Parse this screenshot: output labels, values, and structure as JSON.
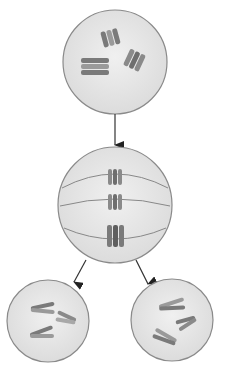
{
  "diagram": {
    "type": "mitosis",
    "stages": [
      {
        "id": "parent-cell",
        "label": "",
        "chromosome_pairs": 3
      },
      {
        "id": "metaphase-cell",
        "label": "",
        "chromosomes_aligned": 3
      },
      {
        "id": "daughter-cell-left",
        "label": "",
        "chromosomes": 3
      },
      {
        "id": "daughter-cell-right",
        "label": "",
        "chromosomes": 3
      }
    ],
    "arrows": [
      {
        "from": "parent-cell",
        "to": "metaphase-cell"
      },
      {
        "from": "metaphase-cell",
        "to": "daughter-cell-left"
      },
      {
        "from": "metaphase-cell",
        "to": "daughter-cell-right"
      }
    ],
    "colors": {
      "cell_fill": "#e8e8e8",
      "cell_stroke": "#8a8a8a",
      "chromosome_dark": "#7a7a7a",
      "chromosome_light": "#a8a8a8",
      "arrow": "#333333",
      "spindle": "#888888"
    }
  }
}
